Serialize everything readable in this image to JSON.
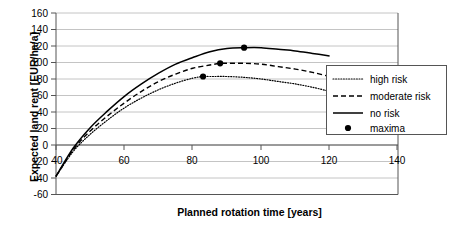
{
  "chart_data": {
    "type": "line",
    "title": "",
    "xlabel": "Planned rotation time [years]",
    "ylabel": "Expected land rent [EUR/ha/a]",
    "xlim": [
      40,
      140
    ],
    "ylim": [
      -60,
      160
    ],
    "xticks": [
      "40",
      "60",
      "80",
      "100",
      "120",
      "140"
    ],
    "yticks": [
      "160",
      "140",
      "120",
      "100",
      "80",
      "60",
      "40",
      "20",
      "0",
      "-20",
      "-40",
      "-60"
    ],
    "grid": true,
    "legend_position": "right",
    "series": [
      {
        "name": "high risk",
        "style": "dotted",
        "x": [
          40,
          45,
          50,
          55,
          60,
          65,
          70,
          75,
          80,
          83,
          85,
          90,
          95,
          100,
          105,
          110,
          115,
          120
        ],
        "values": [
          -38,
          -8,
          13,
          30,
          45,
          57,
          67,
          75,
          81,
          83,
          83,
          83,
          82,
          80,
          77,
          74,
          70,
          65
        ]
      },
      {
        "name": "moderate risk",
        "style": "dashed",
        "x": [
          40,
          45,
          50,
          55,
          60,
          65,
          70,
          75,
          80,
          85,
          88,
          90,
          95,
          100,
          105,
          110,
          115,
          120
        ],
        "values": [
          -38,
          -6,
          17,
          35,
          51,
          65,
          77,
          86,
          93,
          97,
          99,
          99,
          99,
          98,
          95,
          92,
          88,
          83
        ]
      },
      {
        "name": "no risk",
        "style": "solid",
        "x": [
          40,
          45,
          50,
          55,
          60,
          65,
          70,
          75,
          80,
          85,
          90,
          95,
          100,
          105,
          110,
          115,
          120
        ],
        "values": [
          -38,
          -4,
          21,
          41,
          59,
          74,
          87,
          98,
          106,
          113,
          117,
          118,
          118,
          116,
          114,
          111,
          108
        ]
      }
    ],
    "maxima": {
      "name": "maxima",
      "points": [
        {
          "series": "high risk",
          "x": 83,
          "y": 83
        },
        {
          "series": "moderate risk",
          "x": 88,
          "y": 99
        },
        {
          "series": "no risk",
          "x": 95,
          "y": 118
        }
      ]
    },
    "legend": [
      {
        "label": "high risk",
        "style": "dotted"
      },
      {
        "label": "moderate risk",
        "style": "dashed"
      },
      {
        "label": "no risk",
        "style": "solid"
      },
      {
        "label": "maxima",
        "style": "marker"
      }
    ],
    "colors": {
      "series": "#000000",
      "grid": "#b5b5b5",
      "axis": "#555555",
      "background": "#ffffff"
    }
  }
}
